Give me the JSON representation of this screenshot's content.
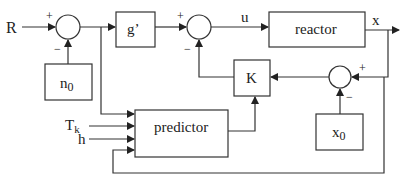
{
  "diagram": {
    "type": "control-loop block diagram",
    "inputs": {
      "reference": "R",
      "tk": "T",
      "tk_sub": "k",
      "h": "h"
    },
    "blocks": {
      "n0": {
        "label": "n",
        "sub": "0"
      },
      "gain_g": {
        "label": "g’"
      },
      "reactor": {
        "label": "reactor"
      },
      "k_gain": {
        "label": "K"
      },
      "x0": {
        "label": "x",
        "sub": "0"
      },
      "predictor": {
        "label": "predictor"
      }
    },
    "signals": {
      "control": "u",
      "output": "x"
    },
    "summing_junctions": {
      "sum1": {
        "plus": "+",
        "minus": "−"
      },
      "sum2": {
        "plus": "+",
        "minus": "−"
      },
      "sum3": {
        "plus": "+",
        "minus": "−"
      }
    }
  }
}
